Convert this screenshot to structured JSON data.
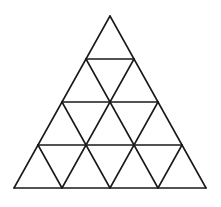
{
  "diagram": {
    "type": "triangular-grid",
    "rows": 4,
    "stroke_color": "#1a1a1a",
    "background_color": "#ffffff",
    "apex": [
      110,
      16
    ],
    "base_y": 188,
    "base_left_x": 14,
    "base_right_x": 206,
    "row_height": 43,
    "half_step": 24
  }
}
